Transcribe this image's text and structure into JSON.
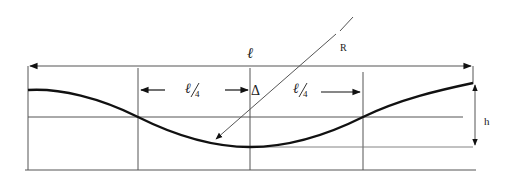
{
  "diagram": {
    "labels": {
      "span": "ℓ",
      "quarter_left_num": "ℓ",
      "quarter_left_den": "4",
      "quarter_right_num": "ℓ",
      "quarter_right_den": "4",
      "delta": "Δ",
      "radius": "R",
      "height": "h"
    },
    "colors": {
      "line": "#555555",
      "curve": "#111111",
      "arrow": "#111111",
      "background": "#ffffff"
    }
  }
}
